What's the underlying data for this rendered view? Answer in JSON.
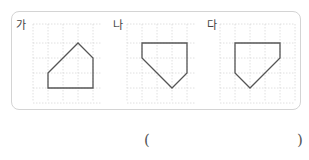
{
  "question_box": {
    "figures": [
      {
        "label": "가",
        "label_pos": [
          16,
          20
        ],
        "grid": {
          "x": 33,
          "y": 24,
          "cols": 4.5,
          "rows": 5.2,
          "cell": 15
        },
        "polygon": [
          [
            48,
            73
          ],
          [
            78,
            43
          ],
          [
            93,
            58
          ],
          [
            93,
            88
          ],
          [
            48,
            88
          ]
        ]
      },
      {
        "label": "나",
        "label_pos": [
          113,
          20
        ],
        "grid": {
          "x": 127,
          "y": 24,
          "cols": 4.6,
          "rows": 5.2,
          "cell": 15
        },
        "polygon": [
          [
            142,
            43
          ],
          [
            187,
            43
          ],
          [
            187,
            73
          ],
          [
            172,
            88
          ],
          [
            142,
            58
          ]
        ]
      },
      {
        "label": "다",
        "label_pos": [
          207,
          20
        ],
        "grid": {
          "x": 220,
          "y": 24,
          "cols": 5.0,
          "rows": 5.2,
          "cell": 15
        },
        "polygon": [
          [
            235,
            43
          ],
          [
            280,
            43
          ],
          [
            280,
            58
          ],
          [
            250,
            88
          ],
          [
            235,
            73
          ]
        ]
      }
    ],
    "colors": {
      "border": "#d4d4d4",
      "grid": "#d8d8d8",
      "shape": "#555555"
    }
  },
  "answer": {
    "open_paren": "(",
    "close_paren": ")",
    "value": ""
  }
}
